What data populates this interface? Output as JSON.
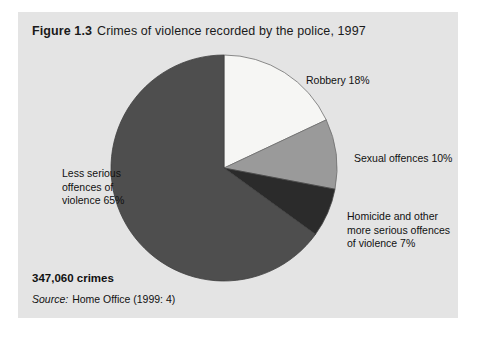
{
  "figure": {
    "number": "Figure 1.3",
    "caption": "Crimes of violence recorded by  the police, 1997",
    "total_label": "347,060 crimes",
    "source_keyword": "Source:",
    "source_value": "Home Office (1999: 4)",
    "background_color": "#e4e4e4",
    "page_color": "#ffffff"
  },
  "labels": {
    "robbery": "Robbery 18%",
    "sexual": "Sexual offences 10%",
    "homicide_line1": "Homicide and other",
    "homicide_line2": "more serious offences",
    "homicide_line3": "of violence 7%",
    "less_serious_line1": "Less serious",
    "less_serious_line2": "offences of",
    "less_serious_line3": "violence 65%"
  },
  "chart_data": {
    "type": "pie",
    "subtitle": "347,060 crimes",
    "source": "Source: Home Office (1999: 4)",
    "total": 347060,
    "total_display": "347,060 crimes",
    "unit": "percent",
    "start_angle_deg": 0,
    "direction": "clockwise",
    "legend": "inline-callouts",
    "grid": false,
    "categories": [
      "Robbery",
      "Sexual offences",
      "Homicide and other more serious offences of violence",
      "Less serious offences of violence"
    ],
    "values": [
      18,
      10,
      7,
      65
    ],
    "value_labels": [
      "18%",
      "10%",
      "7%",
      "65%"
    ],
    "colors": [
      "#f6f6f4",
      "#9a9a9a",
      "#2b2b2b",
      "#4e4e4e"
    ],
    "slices": [
      {
        "name": "Robbery",
        "value": 18,
        "label": "Robbery 18%",
        "color": "#f6f6f4"
      },
      {
        "name": "Sexual offences",
        "value": 10,
        "label": "Sexual offences 10%",
        "color": "#9a9a9a"
      },
      {
        "name": "Homicide and other more serious offences of violence",
        "value": 7,
        "label": "Homicide and other more serious offences of violence 7%",
        "color": "#2b2b2b"
      },
      {
        "name": "Less serious offences of violence",
        "value": 65,
        "label": "Less serious offences of violence 65%",
        "color": "#4e4e4e"
      }
    ]
  }
}
